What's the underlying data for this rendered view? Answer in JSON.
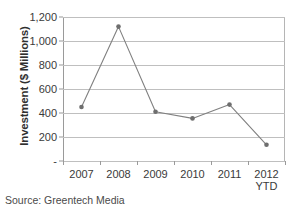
{
  "chart_data": {
    "type": "line",
    "title": "",
    "xlabel": "",
    "ylabel": "Investment ($ Millions)",
    "categories": [
      "2007",
      "2008",
      "2009",
      "2010",
      "2011",
      "2012 YTD"
    ],
    "category_lines": [
      [
        "2007",
        ""
      ],
      [
        "2008",
        ""
      ],
      [
        "2009",
        ""
      ],
      [
        "2010",
        ""
      ],
      [
        "2011",
        ""
      ],
      [
        "2012",
        "YTD"
      ]
    ],
    "values": [
      450,
      1120,
      410,
      355,
      470,
      135
    ],
    "series": [
      {
        "name": "Investment",
        "values": [
          450,
          1120,
          410,
          355,
          470,
          135
        ]
      }
    ],
    "ylim": [
      0,
      1200
    ],
    "ytick_values": [
      0,
      200,
      400,
      600,
      800,
      1000,
      1200
    ],
    "ytick_labels": [
      "-",
      "200",
      "400",
      "600",
      "800",
      "1,000",
      "1,200"
    ],
    "grid": "horizontal",
    "legend": "none",
    "line_color": "#808080",
    "marker_color": "#6e6e6e",
    "gridline_color": "#bfbfbf",
    "background_color": "#ffffff"
  },
  "caption": {
    "source_text": "Source: Greentech Media"
  }
}
